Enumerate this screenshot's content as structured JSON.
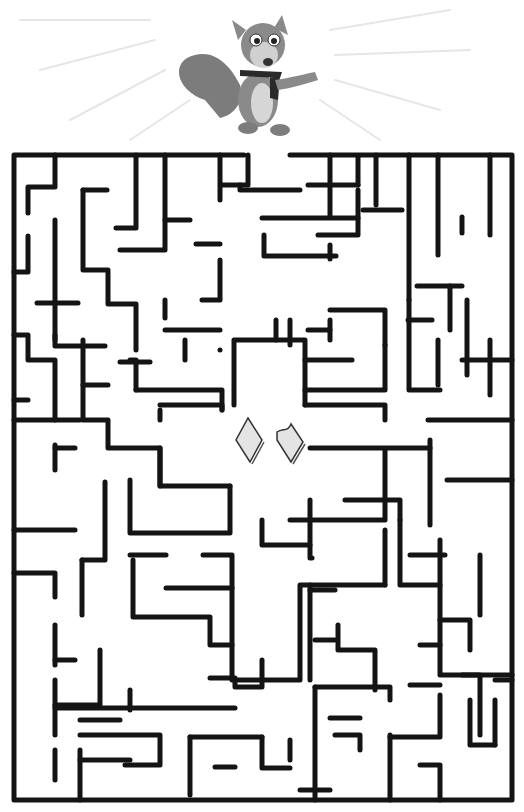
{
  "puzzle": {
    "type": "maze",
    "title": "Squirrel maze",
    "character": "squirrel-with-scarf",
    "goal": "nuts",
    "goal_items": [
      "nut-whole",
      "nut-bitten"
    ],
    "entrance": "top gap",
    "colors": {
      "wall": "#141414",
      "background": "#ffffff",
      "squirrel_fur": "#8a8a8a",
      "squirrel_belly": "#d6d6d6",
      "nut_fill": "#e4e4e4",
      "ray": "#e6e6e6"
    }
  },
  "maze": {
    "border": [
      [
        [
          244,
          155
        ],
        [
          14,
          155
        ],
        [
          14,
          800
        ],
        [
          512,
          800
        ],
        [
          512,
          155
        ],
        [
          290,
          155
        ]
      ]
    ],
    "walls": [
      [
        [
          55,
          155
        ],
        [
          55,
          187
        ],
        [
          28,
          187
        ],
        [
          28,
          213
        ]
      ],
      [
        [
          28,
          236
        ],
        [
          28,
          272
        ],
        [
          14,
          272
        ]
      ],
      [
        [
          55,
          220
        ],
        [
          55,
          340
        ]
      ],
      [
        [
          37,
          303
        ],
        [
          78,
          303
        ]
      ],
      [
        [
          55,
          335
        ],
        [
          55,
          346
        ],
        [
          105,
          346
        ]
      ],
      [
        [
          83,
          190
        ],
        [
          83,
          270
        ],
        [
          108,
          270
        ],
        [
          108,
          304
        ],
        [
          136,
          304
        ],
        [
          136,
          350
        ]
      ],
      [
        [
          83,
          190
        ],
        [
          107,
          190
        ]
      ],
      [
        [
          136,
          155
        ],
        [
          136,
          228
        ],
        [
          116,
          228
        ]
      ],
      [
        [
          165,
          155
        ],
        [
          165,
          250
        ],
        [
          120,
          250
        ]
      ],
      [
        [
          165,
          220
        ],
        [
          190,
          220
        ]
      ],
      [
        [
          165,
          300
        ],
        [
          165,
          318
        ]
      ],
      [
        [
          202,
          300
        ],
        [
          220,
          300
        ],
        [
          220,
          260
        ]
      ],
      [
        [
          220,
          155
        ],
        [
          220,
          200
        ]
      ],
      [
        [
          196,
          244
        ],
        [
          220,
          244
        ]
      ],
      [
        [
          248,
          155
        ],
        [
          248,
          185
        ],
        [
          222,
          185
        ]
      ],
      [
        [
          240,
          185
        ],
        [
          240,
          190
        ],
        [
          300,
          190
        ]
      ],
      [
        [
          262,
          218
        ],
        [
          358,
          218
        ]
      ],
      [
        [
          264,
          235
        ],
        [
          264,
          256
        ],
        [
          336,
          256
        ]
      ],
      [
        [
          330,
          155
        ],
        [
          330,
          215
        ]
      ],
      [
        [
          308,
          185
        ],
        [
          358,
          185
        ]
      ],
      [
        [
          358,
          185
        ],
        [
          358,
          157
        ]
      ],
      [
        [
          358,
          190
        ],
        [
          358,
          235
        ],
        [
          318,
          235
        ]
      ],
      [
        [
          330,
          245
        ],
        [
          330,
          259
        ]
      ],
      [
        [
          376,
          155
        ],
        [
          376,
          205
        ]
      ],
      [
        [
          363,
          210
        ],
        [
          402,
          210
        ]
      ],
      [
        [
          409,
          155
        ],
        [
          409,
          300
        ]
      ],
      [
        [
          438,
          155
        ],
        [
          438,
          255
        ]
      ],
      [
        [
          490,
          155
        ],
        [
          490,
          235
        ]
      ],
      [
        [
          462,
          217
        ],
        [
          462,
          233
        ]
      ],
      [
        [
          467,
          300
        ],
        [
          467,
          375
        ]
      ],
      [
        [
          417,
          286
        ],
        [
          462,
          286
        ]
      ],
      [
        [
          450,
          286
        ],
        [
          450,
          330
        ]
      ],
      [
        [
          408,
          320
        ],
        [
          432,
          320
        ]
      ],
      [
        [
          462,
          360
        ],
        [
          512,
          360
        ]
      ],
      [
        [
          490,
          340
        ],
        [
          490,
          395
        ]
      ],
      [
        [
          14,
          335
        ],
        [
          28,
          335
        ],
        [
          28,
          360
        ],
        [
          55,
          360
        ],
        [
          55,
          420
        ],
        [
          80,
          420
        ]
      ],
      [
        [
          14,
          400
        ],
        [
          28,
          400
        ]
      ],
      [
        [
          14,
          420
        ],
        [
          55,
          420
        ]
      ],
      [
        [
          55,
          445
        ],
        [
          55,
          470
        ]
      ],
      [
        [
          55,
          448
        ],
        [
          75,
          448
        ]
      ],
      [
        [
          83,
          340
        ],
        [
          83,
          420
        ],
        [
          108,
          420
        ],
        [
          108,
          448
        ],
        [
          160,
          448
        ],
        [
          160,
          486
        ]
      ],
      [
        [
          83,
          385
        ],
        [
          108,
          385
        ]
      ],
      [
        [
          130,
          360
        ],
        [
          136,
          360
        ],
        [
          136,
          390
        ]
      ],
      [
        [
          120,
          362
        ],
        [
          150,
          362
        ]
      ],
      [
        [
          165,
          330
        ],
        [
          220,
          330
        ]
      ],
      [
        [
          136,
          390
        ],
        [
          222,
          390
        ],
        [
          222,
          410
        ]
      ],
      [
        [
          160,
          405
        ],
        [
          222,
          405
        ],
        [
          222,
          410
        ]
      ],
      [
        [
          185,
          340
        ],
        [
          185,
          360
        ]
      ],
      [
        [
          220,
          350
        ],
        [
          220,
          350
        ]
      ],
      [
        [
          160,
          410
        ],
        [
          160,
          420
        ]
      ],
      [
        [
          234,
          405
        ],
        [
          234,
          340
        ],
        [
          305,
          340
        ],
        [
          305,
          405
        ]
      ],
      [
        [
          276,
          320
        ],
        [
          276,
          340
        ]
      ],
      [
        [
          305,
          360
        ],
        [
          352,
          360
        ]
      ],
      [
        [
          305,
          390
        ],
        [
          385,
          390
        ],
        [
          385,
          345
        ]
      ],
      [
        [
          305,
          405
        ],
        [
          385,
          405
        ],
        [
          385,
          420
        ]
      ],
      [
        [
          330,
          310
        ],
        [
          385,
          310
        ],
        [
          385,
          345
        ]
      ],
      [
        [
          308,
          330
        ],
        [
          330,
          330
        ]
      ],
      [
        [
          330,
          320
        ],
        [
          330,
          340
        ]
      ],
      [
        [
          409,
          300
        ],
        [
          409,
          390
        ],
        [
          440,
          390
        ]
      ],
      [
        [
          438,
          340
        ],
        [
          438,
          385
        ]
      ],
      [
        [
          428,
          420
        ],
        [
          512,
          420
        ]
      ],
      [
        [
          310,
          448
        ],
        [
          430,
          448
        ]
      ],
      [
        [
          290,
          320
        ],
        [
          290,
          345
        ]
      ],
      [
        [
          160,
          448
        ],
        [
          160,
          486
        ],
        [
          230,
          486
        ]
      ],
      [
        [
          130,
          480
        ],
        [
          130,
          533
        ],
        [
          230,
          533
        ],
        [
          230,
          486
        ]
      ],
      [
        [
          14,
          530
        ],
        [
          75,
          530
        ]
      ],
      [
        [
          14,
          573
        ],
        [
          55,
          573
        ],
        [
          55,
          597
        ]
      ],
      [
        [
          105,
          482
        ],
        [
          105,
          560
        ],
        [
          82,
          560
        ]
      ],
      [
        [
          82,
          560
        ],
        [
          82,
          615
        ]
      ],
      [
        [
          55,
          625
        ],
        [
          55,
          665
        ]
      ],
      [
        [
          55,
          660
        ],
        [
          75,
          660
        ]
      ],
      [
        [
          130,
          555
        ],
        [
          166,
          555
        ]
      ],
      [
        [
          203,
          555
        ],
        [
          230,
          555
        ]
      ],
      [
        [
          133,
          560
        ],
        [
          133,
          617
        ],
        [
          210,
          617
        ],
        [
          210,
          645
        ],
        [
          232,
          645
        ]
      ],
      [
        [
          166,
          588
        ],
        [
          232,
          588
        ]
      ],
      [
        [
          232,
          555
        ],
        [
          232,
          680
        ],
        [
          300,
          680
        ],
        [
          300,
          585
        ],
        [
          385,
          585
        ]
      ],
      [
        [
          290,
          520
        ],
        [
          385,
          520
        ],
        [
          385,
          450
        ]
      ],
      [
        [
          262,
          520
        ],
        [
          262,
          545
        ],
        [
          310,
          545
        ]
      ],
      [
        [
          310,
          500
        ],
        [
          310,
          558
        ],
        [
          312,
          558
        ]
      ],
      [
        [
          345,
          500
        ],
        [
          400,
          500
        ],
        [
          400,
          520
        ]
      ],
      [
        [
          430,
          440
        ],
        [
          430,
          525
        ]
      ],
      [
        [
          447,
          480
        ],
        [
          512,
          480
        ]
      ],
      [
        [
          410,
          555
        ],
        [
          445,
          555
        ]
      ],
      [
        [
          385,
          530
        ],
        [
          385,
          585
        ]
      ],
      [
        [
          310,
          585
        ],
        [
          310,
          680
        ]
      ],
      [
        [
          310,
          590
        ],
        [
          335,
          590
        ]
      ],
      [
        [
          315,
          640
        ],
        [
          335,
          640
        ]
      ],
      [
        [
          338,
          625
        ],
        [
          338,
          650
        ],
        [
          375,
          650
        ],
        [
          375,
          690
        ]
      ],
      [
        [
          400,
          520
        ],
        [
          400,
          585
        ],
        [
          440,
          585
        ]
      ],
      [
        [
          440,
          540
        ],
        [
          440,
          675
        ],
        [
          480,
          675
        ],
        [
          480,
          735
        ]
      ],
      [
        [
          440,
          620
        ],
        [
          470,
          620
        ],
        [
          470,
          650
        ]
      ],
      [
        [
          420,
          645
        ],
        [
          440,
          645
        ]
      ],
      [
        [
          480,
          555
        ],
        [
          480,
          615
        ]
      ],
      [
        [
          462,
          675
        ],
        [
          512,
          675
        ]
      ],
      [
        [
          410,
          685
        ],
        [
          440,
          685
        ]
      ],
      [
        [
          55,
          680
        ],
        [
          55,
          735
        ]
      ],
      [
        [
          55,
          705
        ],
        [
          100,
          705
        ],
        [
          100,
          650
        ]
      ],
      [
        [
          55,
          750
        ],
        [
          55,
          780
        ]
      ],
      [
        [
          80,
          750
        ],
        [
          80,
          800
        ]
      ],
      [
        [
          80,
          760
        ],
        [
          130,
          760
        ]
      ],
      [
        [
          80,
          735
        ],
        [
          160,
          735
        ],
        [
          160,
          765
        ],
        [
          125,
          765
        ]
      ],
      [
        [
          80,
          720
        ],
        [
          120,
          720
        ]
      ],
      [
        [
          130,
          690
        ],
        [
          130,
          710
        ]
      ],
      [
        [
          55,
          708
        ],
        [
          235,
          708
        ]
      ],
      [
        [
          210,
          678
        ],
        [
          235,
          678
        ],
        [
          235,
          687
        ],
        [
          262,
          687
        ]
      ],
      [
        [
          262,
          660
        ],
        [
          262,
          685
        ]
      ],
      [
        [
          190,
          737
        ],
        [
          190,
          795
        ]
      ],
      [
        [
          190,
          737
        ],
        [
          262,
          737
        ]
      ],
      [
        [
          215,
          767
        ],
        [
          235,
          767
        ]
      ],
      [
        [
          262,
          737
        ],
        [
          262,
          768
        ],
        [
          290,
          768
        ]
      ],
      [
        [
          290,
          740
        ],
        [
          290,
          760
        ]
      ],
      [
        [
          315,
          687
        ],
        [
          315,
          800
        ]
      ],
      [
        [
          315,
          687
        ],
        [
          390,
          687
        ],
        [
          390,
          700
        ]
      ],
      [
        [
          330,
          718
        ],
        [
          360,
          718
        ]
      ],
      [
        [
          335,
          735
        ],
        [
          360,
          735
        ],
        [
          360,
          750
        ]
      ],
      [
        [
          300,
          790
        ],
        [
          330,
          790
        ]
      ],
      [
        [
          390,
          735
        ],
        [
          390,
          800
        ]
      ],
      [
        [
          390,
          737
        ],
        [
          440,
          737
        ],
        [
          440,
          695
        ]
      ],
      [
        [
          420,
          765
        ],
        [
          440,
          765
        ]
      ],
      [
        [
          440,
          767
        ],
        [
          440,
          800
        ]
      ],
      [
        [
          470,
          700
        ],
        [
          470,
          745
        ],
        [
          495,
          745
        ]
      ],
      [
        [
          495,
          700
        ],
        [
          495,
          745
        ]
      ],
      [
        [
          495,
          680
        ],
        [
          512,
          680
        ]
      ]
    ],
    "center_chamber": [
      [
        234,
        338
      ],
      [
        305,
        338
      ],
      [
        305,
        415
      ],
      [
        385,
        415
      ],
      [
        385,
        445
      ],
      [
        308,
        445
      ],
      [
        308,
        682
      ],
      [
        236,
        682
      ],
      [
        236,
        505
      ],
      [
        210,
        505
      ],
      [
        160,
        505
      ],
      [
        160,
        415
      ],
      [
        234,
        415
      ],
      [
        234,
        338
      ]
    ]
  }
}
